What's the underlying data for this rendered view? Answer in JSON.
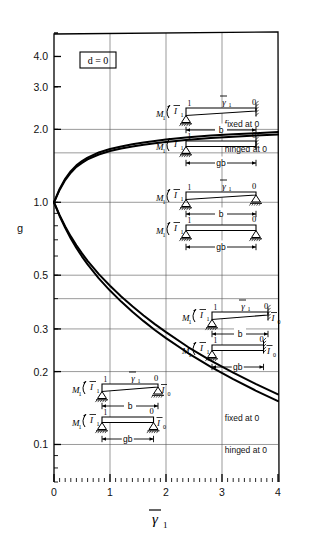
{
  "chart_data": {
    "type": "line",
    "title": "",
    "xlabel": "γ̄1",
    "ylabel": "g",
    "xlim": [
      0,
      4
    ],
    "ylim": [
      0.07,
      5.0
    ],
    "yscale": "log",
    "xscale": "linear",
    "grid": true,
    "legend": "none",
    "xticks": [
      "0",
      "1",
      "2",
      "3",
      "4"
    ],
    "xtick_values": [
      0,
      1,
      2,
      3,
      4
    ],
    "yticks": [
      "4.0",
      "3.0",
      "2.0",
      "1.0",
      "0.5",
      "0.3",
      "0.2",
      "0.1"
    ],
    "ytick_values": [
      4.0,
      3.0,
      2.0,
      1.0,
      0.5,
      0.3,
      0.2,
      0.1
    ],
    "series": [
      {
        "name": "fixed at 0 (upper)",
        "points": [
          [
            0,
            1.0
          ],
          [
            0.1,
            1.135
          ],
          [
            0.2,
            1.25
          ],
          [
            0.3,
            1.345
          ],
          [
            0.4,
            1.42
          ],
          [
            0.5,
            1.48
          ],
          [
            0.6,
            1.53
          ],
          [
            0.8,
            1.605
          ],
          [
            1.0,
            1.66
          ],
          [
            1.2,
            1.7
          ],
          [
            1.4,
            1.735
          ],
          [
            1.6,
            1.765
          ],
          [
            1.8,
            1.79
          ],
          [
            2.0,
            1.815
          ],
          [
            2.4,
            1.855
          ],
          [
            2.8,
            1.885
          ],
          [
            3.2,
            1.91
          ],
          [
            3.6,
            1.93
          ],
          [
            4.0,
            1.95
          ]
        ]
      },
      {
        "name": "hinged at 0 (upper)",
        "points": [
          [
            0,
            1.0
          ],
          [
            0.1,
            1.125
          ],
          [
            0.2,
            1.235
          ],
          [
            0.3,
            1.325
          ],
          [
            0.4,
            1.4
          ],
          [
            0.5,
            1.455
          ],
          [
            0.6,
            1.505
          ],
          [
            0.8,
            1.575
          ],
          [
            1.0,
            1.628
          ],
          [
            1.2,
            1.668
          ],
          [
            1.4,
            1.7
          ],
          [
            1.6,
            1.728
          ],
          [
            1.8,
            1.752
          ],
          [
            2.0,
            1.775
          ],
          [
            2.4,
            1.812
          ],
          [
            2.8,
            1.842
          ],
          [
            3.2,
            1.866
          ],
          [
            3.6,
            1.886
          ],
          [
            4.0,
            1.903
          ]
        ]
      },
      {
        "name": "fixed at 0 (lower)",
        "points": [
          [
            0,
            1.0
          ],
          [
            0.1,
            0.885
          ],
          [
            0.2,
            0.795
          ],
          [
            0.3,
            0.723
          ],
          [
            0.4,
            0.665
          ],
          [
            0.5,
            0.615
          ],
          [
            0.6,
            0.573
          ],
          [
            0.8,
            0.505
          ],
          [
            1.0,
            0.452
          ],
          [
            1.2,
            0.408
          ],
          [
            1.4,
            0.372
          ],
          [
            1.6,
            0.341
          ],
          [
            1.8,
            0.314
          ],
          [
            2.0,
            0.291
          ],
          [
            2.4,
            0.252
          ],
          [
            2.8,
            0.222
          ],
          [
            3.2,
            0.198
          ],
          [
            3.6,
            0.178
          ],
          [
            4.0,
            0.161
          ]
        ]
      },
      {
        "name": "hinged at 0 (lower)",
        "points": [
          [
            0,
            1.0
          ],
          [
            0.1,
            0.878
          ],
          [
            0.2,
            0.784
          ],
          [
            0.3,
            0.709
          ],
          [
            0.4,
            0.648
          ],
          [
            0.5,
            0.597
          ],
          [
            0.6,
            0.554
          ],
          [
            0.8,
            0.485
          ],
          [
            1.0,
            0.432
          ],
          [
            1.2,
            0.389
          ],
          [
            1.4,
            0.353
          ],
          [
            1.6,
            0.323
          ],
          [
            1.8,
            0.297
          ],
          [
            2.0,
            0.275
          ],
          [
            2.4,
            0.238
          ],
          [
            2.8,
            0.209
          ],
          [
            3.2,
            0.186
          ],
          [
            3.6,
            0.167
          ],
          [
            4.0,
            0.151
          ]
        ]
      }
    ],
    "gridlines_h": [
      2.0,
      1.6,
      1.0,
      0.5,
      0.4,
      0.3,
      0.2,
      0.1
    ],
    "gridlines_v": [
      1.0,
      2.0,
      3.0
    ],
    "annotations": [
      {
        "text": "fixed at 0",
        "x": 3.05,
        "y": 2.05
      },
      {
        "text": "hinged at 0",
        "x": 3.05,
        "y": 1.62
      },
      {
        "text": "fixed at 0",
        "x": 3.05,
        "y": 0.125
      },
      {
        "text": "hinged at 0",
        "x": 3.05,
        "y": 0.092
      }
    ]
  },
  "plot": {
    "case_label": "d = 0",
    "axis_y_label": "g",
    "axis_x_label_gamma": "γ",
    "axis_x_label_sub": "1"
  },
  "diagrams": {
    "groups": [
      {
        "id": "upper-group",
        "beams": [
          {
            "moment": "M",
            "moment_sub": "1",
            "inertia": "I",
            "inertia_sub": "1",
            "load": "γ",
            "load_sub": "1",
            "node_left": "1",
            "node_right": "0",
            "span_label": "b",
            "right_support": "fixed"
          },
          {
            "moment": "M",
            "moment_sub": "1",
            "inertia": "I",
            "inertia_sub": "1",
            "load": "",
            "load_sub": "",
            "node_left": "1",
            "node_right": "0",
            "span_label": "gb",
            "right_support": "fixed"
          }
        ]
      },
      {
        "id": "upper-hinged-group",
        "beams": [
          {
            "moment": "M",
            "moment_sub": "1",
            "inertia": "I",
            "inertia_sub": "1",
            "load": "γ",
            "load_sub": "1",
            "node_left": "1",
            "node_right": "0",
            "span_label": "b",
            "right_support": "pin"
          },
          {
            "moment": "M",
            "moment_sub": "1",
            "inertia": "I",
            "inertia_sub": "1",
            "load": "",
            "load_sub": "",
            "node_left": "1",
            "node_right": "0",
            "span_label": "gb",
            "right_support": "pin"
          }
        ]
      },
      {
        "id": "lower-right-group",
        "beams": [
          {
            "moment": "M",
            "moment_sub": "1",
            "inertia": "I",
            "inertia_sub": "1",
            "load": "γ",
            "load_sub": "1",
            "node_left": "1",
            "node_right": "0",
            "span_label": "b",
            "right_support": "fixed",
            "right_inertia": "I",
            "right_inertia_sub": "0"
          },
          {
            "moment": "M",
            "moment_sub": "1",
            "inertia": "I",
            "inertia_sub": "1",
            "load": "",
            "load_sub": "",
            "node_left": "1",
            "node_right": "0",
            "span_label": "gb",
            "right_support": "fixed",
            "right_inertia": "I",
            "right_inertia_sub": "0"
          }
        ]
      },
      {
        "id": "lower-left-group",
        "beams": [
          {
            "moment": "M",
            "moment_sub": "1",
            "inertia": "I",
            "inertia_sub": "1",
            "load": "γ",
            "load_sub": "1",
            "node_left": "1",
            "node_right": "0",
            "span_label": "b",
            "right_support": "pin",
            "right_inertia": "I",
            "right_inertia_sub": "0"
          },
          {
            "moment": "M",
            "moment_sub": "1",
            "inertia": "I",
            "inertia_sub": "1",
            "load": "",
            "load_sub": "",
            "node_left": "1",
            "node_right": "0",
            "span_label": "gb",
            "right_support": "pin",
            "right_inertia": "I",
            "right_inertia_sub": "0"
          }
        ]
      }
    ]
  },
  "colors": {
    "curve": "#000000",
    "grid": "#555555",
    "axis": "#000000",
    "background": "#ffffff"
  }
}
